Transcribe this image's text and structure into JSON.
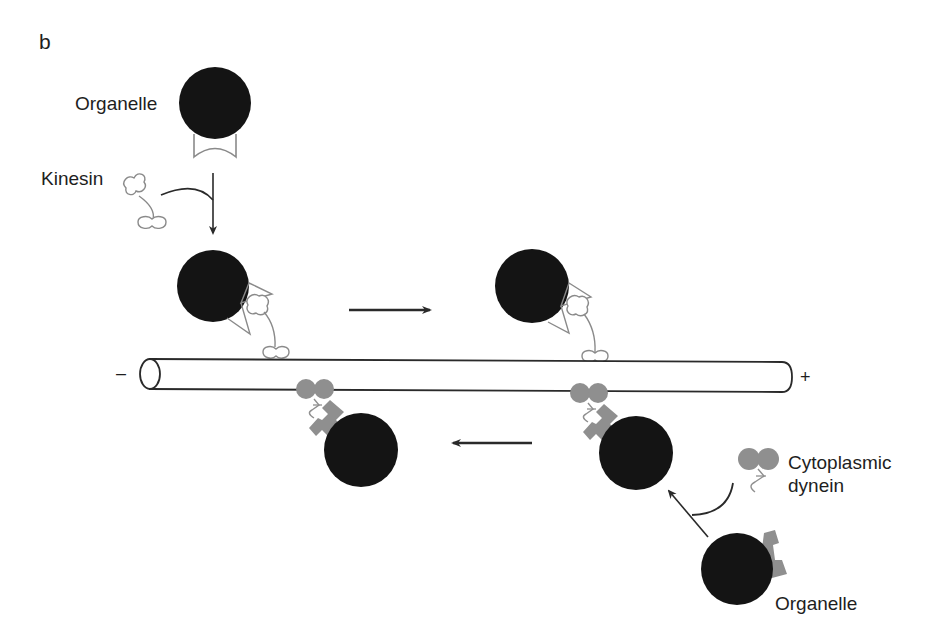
{
  "figure": {
    "panel_label": "b",
    "colors": {
      "organelle": "#141414",
      "kinesin_outline": "#8a8a8a",
      "dynein_fill": "#8f8f8f",
      "microtubule_stroke": "#2a2a2a",
      "arrow": "#2a2a2a",
      "background": "#ffffff"
    },
    "labels": {
      "organelle_top": "Organelle",
      "kinesin": "Kinesin",
      "cytoplasmic": "Cytoplasmic",
      "dynein": "dynein",
      "organelle_bottom": "Organelle",
      "minus_end": "–",
      "plus_end": "+"
    },
    "microtubule": {
      "minus_label": "–",
      "plus_label": "+",
      "orientation": "horizontal"
    },
    "transport_arrows": [
      {
        "direction": "right",
        "motor": "kinesin",
        "meaning": "anterograde toward + end"
      },
      {
        "direction": "left",
        "motor": "cytoplasmic dynein",
        "meaning": "retrograde toward – end"
      }
    ]
  }
}
